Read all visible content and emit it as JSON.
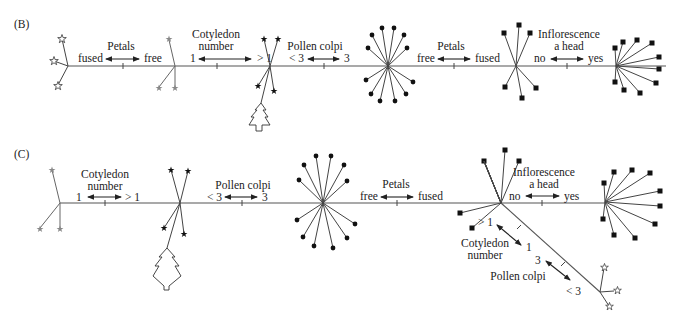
{
  "figure": {
    "panels": [
      {
        "id": "B",
        "label": "(B)",
        "characters": [
          {
            "title": "Petals",
            "title2": "",
            "left": "fused",
            "right": "free"
          },
          {
            "title": "Cotyledon",
            "title2": "number",
            "left": "1",
            "right": "> 1"
          },
          {
            "title": "Pollen colpi",
            "title2": "",
            "left": "< 3",
            "right": "3"
          },
          {
            "title": "Petals",
            "title2": "",
            "left": "free",
            "right": "fused"
          },
          {
            "title": "Inflorescence",
            "title2": "a head",
            "left": "no",
            "right": "yes"
          }
        ]
      },
      {
        "id": "C",
        "label": "(C)",
        "characters": [
          {
            "title": "Cotyledon",
            "title2": "number",
            "left": "1",
            "right": "> 1"
          },
          {
            "title": "Pollen colpi",
            "title2": "",
            "left": "< 3",
            "right": "3"
          },
          {
            "title": "Petals",
            "title2": "",
            "left": "free",
            "right": "fused"
          },
          {
            "title": "Inflorescence",
            "title2": "a head",
            "left": "no",
            "right": "yes"
          }
        ],
        "branch_characters": [
          {
            "title": "Cotyledon",
            "title2": "number",
            "upper": "> 1",
            "lower": "1"
          },
          {
            "title": "Pollen colpi",
            "title2": "",
            "upper": "3",
            "lower": "< 3"
          }
        ]
      }
    ],
    "node_markers": {
      "open_star": "open-star-icon",
      "grey_star": "grey-star-icon",
      "solid_star": "solid-star-icon",
      "tree": "tree-icon",
      "dot": "dot-icon",
      "square": "square-icon"
    },
    "colors": {
      "line": "#444444",
      "text": "#222222",
      "marker": "#111111",
      "grey_marker": "#888888"
    }
  }
}
